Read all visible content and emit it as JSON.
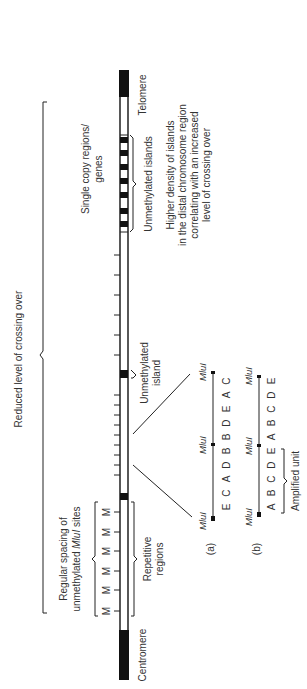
{
  "figure": {
    "orientation": "rotated-90-ccw",
    "chromosome": {
      "left_end_label": "Centromere",
      "right_end_label": "Telomere"
    },
    "top_labels": {
      "reduced_crossing": "Reduced level of crossing over",
      "regular_spacing_line1": "Regular spacing of",
      "regular_spacing_line2_pre": "unmethylated ",
      "regular_spacing_line2_italic": "MluI",
      "regular_spacing_line2_post": " sites",
      "single_copy_line1": "Single copy regions/",
      "single_copy_line2": "genes"
    },
    "m_sites": [
      "M",
      "M",
      "M",
      "M",
      "M",
      "M"
    ],
    "bottom_labels": {
      "repetitive_line1": "Repetitive",
      "repetitive_line2": "regions",
      "unmethylated_island_line1": "Unmethylated",
      "unmethylated_island_line2": "island",
      "unmethylated_islands": "Unmethylated islands",
      "higher_density_line1": "Higher density of islands",
      "higher_density_line2": "in the distal chromosome region",
      "higher_density_line3": "correlating with an increased",
      "higher_density_line4": "level of crossing over"
    },
    "map_a": {
      "label": "(a)",
      "enzyme": "MluI",
      "fragments_left": [
        "E",
        "C",
        "A",
        "D",
        "B"
      ],
      "fragments_right": [
        "B",
        "D",
        "E",
        "A",
        "C"
      ]
    },
    "map_b": {
      "label": "(b)",
      "enzyme": "MluI",
      "fragments_left": [
        "A",
        "B",
        "C",
        "D",
        "E"
      ],
      "fragments_right": [
        "A",
        "B",
        "C",
        "D",
        "E"
      ],
      "bracket_label": "Amplified unit"
    }
  }
}
